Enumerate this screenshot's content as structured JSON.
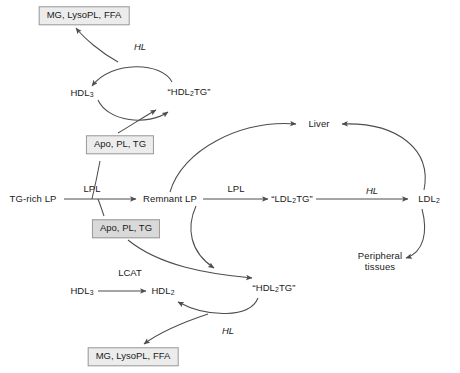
{
  "diagram": {
    "stroke_color": "#4d4d4d",
    "box_fill": "#ececed",
    "box_fill_shaded": "#d9d9da",
    "box_border": "#9a9a9a",
    "text_color": "#1a1a1a",
    "background": "#ffffff"
  },
  "nodes": {
    "products_top": "MG, LysoPL, FFA",
    "hdl3_top": "HDL",
    "hdl3_top_sub": "3",
    "hdl2tg_top_open": "“HDL",
    "hdl2tg_top_sub": "2",
    "hdl2tg_top_close": "TG”",
    "apo_pl_tg_upper": "Apo, PL, TG",
    "apo_pl_tg_lower": "Apo, PL, TG",
    "tg_rich_lp": "TG-rich LP",
    "remnant_lp": "Remnant LP",
    "ldl2tg_open": "“LDL",
    "ldl2tg_sub": "2",
    "ldl2tg_close": "TG”",
    "ldl2": "LDL",
    "ldl2_sub": "2",
    "liver": "Liver",
    "peripheral_line1": "Peripheral",
    "peripheral_line2": "tissues",
    "hdl3_bottom": "HDL",
    "hdl3_bottom_sub": "3",
    "hdl2_bottom": "HDL",
    "hdl2_bottom_sub": "2",
    "hdl2tg_bottom_open": "“HDL",
    "hdl2tg_bottom_sub": "2",
    "hdl2tg_bottom_close": "TG”",
    "products_bottom": "MG, LysoPL, FFA"
  },
  "enzymes": {
    "hl_top": "HL",
    "lpl_left": "LPL",
    "lpl_right": "LPL",
    "hl_right": "HL",
    "lcat": "LCAT",
    "hl_bottom": "HL"
  }
}
